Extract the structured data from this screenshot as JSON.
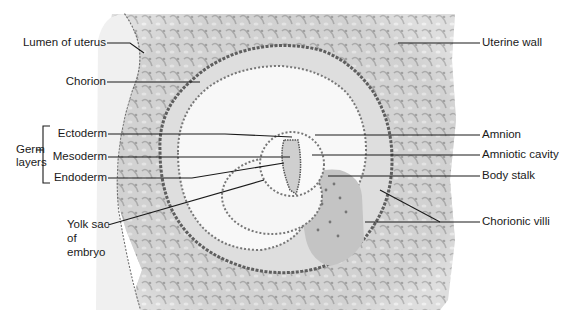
{
  "figure": {
    "labels_left": [
      {
        "id": "lumen",
        "text": "Lumen of uterus"
      },
      {
        "id": "chorion",
        "text": "Chorion"
      },
      {
        "id": "ectoderm",
        "text": "Ectoderm"
      },
      {
        "id": "mesoderm",
        "text": "Mesoderm"
      },
      {
        "id": "endoderm",
        "text": "Endoderm"
      },
      {
        "id": "yolk_sac_1",
        "text": "Yolk sac"
      },
      {
        "id": "yolk_sac_2",
        "text": "of"
      },
      {
        "id": "yolk_sac_3",
        "text": "embryo"
      }
    ],
    "group_label": {
      "line1": "Germ",
      "line2": "layers"
    },
    "labels_right": [
      {
        "id": "uterine_wall",
        "text": "Uterine wall"
      },
      {
        "id": "amnion",
        "text": "Amnion"
      },
      {
        "id": "amniotic_cavity",
        "text": "Amniotic cavity"
      },
      {
        "id": "body_stalk",
        "text": "Body stalk"
      },
      {
        "id": "chorionic_villi",
        "text": "Chorionic villi"
      }
    ]
  },
  "colors": {
    "tissue_fill": "#cfcfcf",
    "tissue_light": "#e6e6e6",
    "cavity_fill": "#f7f7f7",
    "cell_dots": "#6a6a6a",
    "leader_line": "#1a1a1a"
  }
}
